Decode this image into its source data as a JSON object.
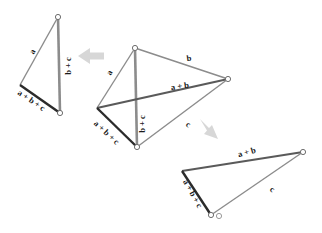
{
  "figure": {
    "background_color": "#ffffff",
    "thin_stroke_color": "#8c8c8c",
    "thick_stroke_color": "#3a3a3a",
    "resultant_stroke_color": "#2b2b2b",
    "arrow_color": "#d5d5d5",
    "label_color": "#1a1a1a",
    "vertex_marker_color": "#6e6e6e"
  },
  "panels": [
    {
      "name": "left-triangle",
      "labels": [
        {
          "id": "left-a",
          "text": "a",
          "x": 33,
          "y": 52,
          "rotate": -62
        },
        {
          "id": "left-bc",
          "text": "b + c",
          "x": 69,
          "y": 66,
          "rotate": -90
        },
        {
          "id": "left-abc",
          "text": "a + b + c",
          "x": 31,
          "y": 101,
          "rotate": 34
        }
      ]
    },
    {
      "name": "middle-quadrilateral",
      "labels": [
        {
          "id": "mid-a",
          "text": "a",
          "x": 110,
          "y": 73,
          "rotate": -62
        },
        {
          "id": "mid-b",
          "text": "b",
          "x": 189,
          "y": 59,
          "rotate": -8
        },
        {
          "id": "mid-ab",
          "text": "a + b",
          "x": 180,
          "y": 87,
          "rotate": -8
        },
        {
          "id": "mid-c",
          "text": "c",
          "x": 188,
          "y": 125,
          "rotate": 32
        },
        {
          "id": "mid-bc",
          "text": "b + c",
          "x": 143,
          "y": 124,
          "rotate": -90
        },
        {
          "id": "mid-abc",
          "text": "a + b + c",
          "x": 106,
          "y": 133,
          "rotate": 43
        }
      ]
    },
    {
      "name": "right-triangle",
      "labels": [
        {
          "id": "right-ab",
          "text": "a + b",
          "x": 247,
          "y": 153,
          "rotate": -16
        },
        {
          "id": "right-c",
          "text": "c",
          "x": 272,
          "y": 190,
          "rotate": 35
        },
        {
          "id": "right-abc",
          "text": "a + b + c",
          "x": 192,
          "y": 194,
          "rotate": 61
        }
      ]
    }
  ],
  "arrows": [
    {
      "id": "arrow-to-left",
      "direction": "left",
      "x": 95,
      "y": 56
    },
    {
      "id": "arrow-to-right",
      "direction": "down-right",
      "x": 212,
      "y": 132
    }
  ],
  "geometry": {
    "left_triangle": {
      "apex_top": [
        58,
        17
      ],
      "left": [
        20,
        85
      ],
      "bottom": [
        60,
        113
      ],
      "thin_edges": [
        [
          58,
          17,
          20,
          85
        ],
        [
          58,
          17,
          60,
          113
        ]
      ],
      "thick_edges": [
        [
          20,
          85,
          60,
          113
        ]
      ]
    },
    "middle_quad": {
      "top": [
        135,
        48
      ],
      "right": [
        228,
        79
      ],
      "bottom": [
        137,
        147
      ],
      "left": [
        97,
        108
      ],
      "thin_edges": [
        [
          135,
          48,
          97,
          108
        ],
        [
          135,
          48,
          228,
          79
        ],
        [
          228,
          79,
          137,
          147
        ],
        [
          97,
          108,
          135,
          48
        ]
      ],
      "thick_edges": [
        [
          97,
          108,
          228,
          79
        ],
        [
          135,
          48,
          137,
          147
        ],
        [
          97,
          108,
          137,
          147
        ]
      ]
    },
    "right_triangle": {
      "left": [
        182,
        171
      ],
      "right": [
        303,
        152
      ],
      "bottom": [
        211,
        215
      ],
      "thin_edges": [
        [
          303,
          152,
          211,
          215
        ]
      ],
      "thick_edges": [
        [
          182,
          171,
          303,
          152
        ],
        [
          182,
          171,
          211,
          215
        ]
      ]
    }
  }
}
